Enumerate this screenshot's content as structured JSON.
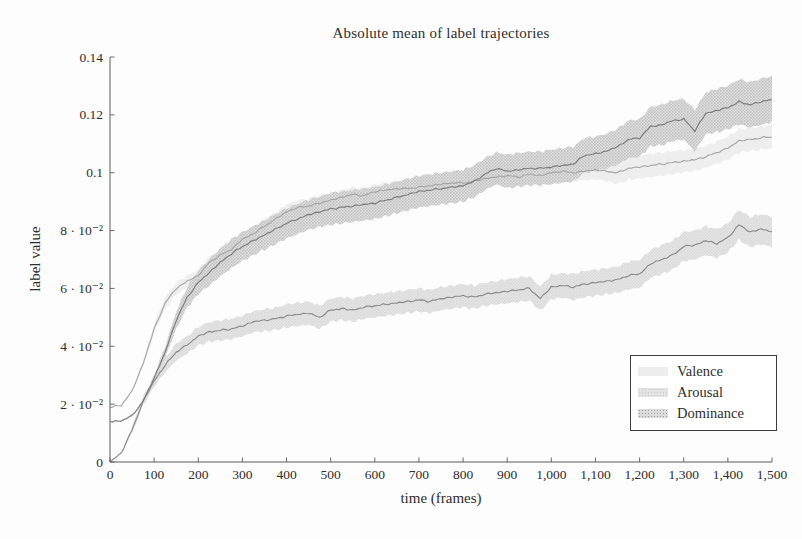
{
  "page": {
    "background": "#fdfdfd",
    "text_color": "#2e2e2e",
    "axis_color": "#5a5a5a"
  },
  "chart_data": {
    "type": "line",
    "title": "Absolute mean of label trajectories",
    "xlabel": "time (frames)",
    "ylabel": "label value",
    "xlim": [
      0,
      1500
    ],
    "ylim": [
      0,
      0.14
    ],
    "grid": false,
    "frame": "open-left-bottom",
    "xticks": {
      "values": [
        0,
        100,
        200,
        300,
        400,
        500,
        600,
        700,
        800,
        900,
        1000,
        1100,
        1200,
        1300,
        1400,
        1500
      ],
      "labels": [
        "0",
        "100",
        "200",
        "300",
        "400",
        "500",
        "600",
        "700",
        "800",
        "900",
        "1,000",
        "1,100",
        "1,200",
        "1,300",
        "1,400",
        "1,500"
      ]
    },
    "yticks": {
      "values": [
        0,
        0.02,
        0.04,
        0.06,
        0.08,
        0.1,
        0.12,
        0.14
      ],
      "labels": [
        "0",
        "2 · 10⁻²",
        "4 · 10⁻²",
        "6 · 10⁻²",
        "8 · 10⁻²",
        "0.1",
        "0.12",
        "0.14"
      ]
    },
    "legend": {
      "position": "bottom-right",
      "entries": [
        "Valence",
        "Arousal",
        "Dominance"
      ]
    },
    "x": [
      0,
      25,
      50,
      75,
      100,
      125,
      150,
      175,
      200,
      225,
      250,
      275,
      300,
      325,
      350,
      375,
      400,
      425,
      450,
      475,
      500,
      525,
      550,
      575,
      600,
      625,
      650,
      675,
      700,
      725,
      750,
      775,
      800,
      825,
      850,
      875,
      900,
      925,
      950,
      975,
      1000,
      1025,
      1050,
      1075,
      1100,
      1125,
      1150,
      1175,
      1200,
      1225,
      1250,
      1275,
      1300,
      1325,
      1350,
      1375,
      1400,
      1425,
      1450,
      1475,
      1500
    ],
    "series": [
      {
        "name": "Valence",
        "line_color": "#a6a6a6",
        "band_color": "#ededed",
        "band_dot_color": null,
        "values": [
          0.019,
          0.0195,
          0.0245,
          0.034,
          0.046,
          0.055,
          0.06,
          0.0625,
          0.0645,
          0.069,
          0.0715,
          0.0735,
          0.077,
          0.079,
          0.0815,
          0.084,
          0.0865,
          0.088,
          0.0885,
          0.0895,
          0.0905,
          0.0915,
          0.0925,
          0.092,
          0.0935,
          0.094,
          0.0945,
          0.0945,
          0.095,
          0.0955,
          0.096,
          0.0965,
          0.0965,
          0.097,
          0.098,
          0.0985,
          0.099,
          0.0985,
          0.0995,
          0.099,
          0.1,
          0.1005,
          0.1,
          0.1005,
          0.101,
          0.1005,
          0.1,
          0.1015,
          0.102,
          0.1025,
          0.103,
          0.1035,
          0.104,
          0.1045,
          0.1055,
          0.107,
          0.1085,
          0.111,
          0.1115,
          0.112,
          0.1125
        ],
        "band": [
          0,
          0,
          0,
          0.001,
          0.0015,
          0.002,
          0.002,
          0.002,
          0.002,
          0.002,
          0.002,
          0.002,
          0.0022,
          0.0022,
          0.0022,
          0.0022,
          0.0025,
          0.0025,
          0.0025,
          0.0025,
          0.0025,
          0.0025,
          0.0025,
          0.0025,
          0.0025,
          0.0025,
          0.0025,
          0.0025,
          0.0025,
          0.0025,
          0.0025,
          0.0025,
          0.0025,
          0.0025,
          0.0025,
          0.0028,
          0.0028,
          0.0028,
          0.0028,
          0.0028,
          0.003,
          0.003,
          0.003,
          0.003,
          0.0032,
          0.0035,
          0.0038,
          0.004,
          0.004,
          0.004,
          0.004,
          0.004,
          0.0038,
          0.0038,
          0.0038,
          0.0038,
          0.004,
          0.004,
          0.004,
          0.004,
          0.004
        ]
      },
      {
        "name": "Arousal",
        "line_color": "#8a8a8a",
        "band_color": "#e3e3e3",
        "band_dot_color": "#cccccc",
        "values": [
          0.0,
          0.003,
          0.011,
          0.021,
          0.028,
          0.0335,
          0.038,
          0.0405,
          0.0435,
          0.045,
          0.0455,
          0.046,
          0.047,
          0.0485,
          0.049,
          0.0495,
          0.0505,
          0.051,
          0.0515,
          0.05,
          0.0525,
          0.053,
          0.0525,
          0.0535,
          0.054,
          0.0545,
          0.055,
          0.0555,
          0.056,
          0.0555,
          0.0565,
          0.057,
          0.0575,
          0.057,
          0.058,
          0.0585,
          0.059,
          0.0595,
          0.06,
          0.0565,
          0.0605,
          0.061,
          0.0605,
          0.0615,
          0.062,
          0.0625,
          0.063,
          0.0645,
          0.065,
          0.0685,
          0.07,
          0.0715,
          0.0745,
          0.075,
          0.0765,
          0.0755,
          0.0775,
          0.082,
          0.0795,
          0.0805,
          0.0795
        ],
        "band": [
          0,
          0,
          0.001,
          0.0015,
          0.002,
          0.0025,
          0.003,
          0.003,
          0.0032,
          0.0034,
          0.0035,
          0.0035,
          0.0036,
          0.0036,
          0.0038,
          0.0038,
          0.004,
          0.004,
          0.004,
          0.004,
          0.004,
          0.004,
          0.004,
          0.004,
          0.004,
          0.004,
          0.004,
          0.004,
          0.004,
          0.004,
          0.004,
          0.004,
          0.004,
          0.004,
          0.004,
          0.004,
          0.0042,
          0.0042,
          0.0042,
          0.0042,
          0.0042,
          0.0042,
          0.0045,
          0.0045,
          0.0045,
          0.0045,
          0.0045,
          0.0048,
          0.0048,
          0.0048,
          0.005,
          0.005,
          0.005,
          0.005,
          0.005,
          0.005,
          0.005,
          0.0052,
          0.0052,
          0.0052,
          0.0052
        ]
      },
      {
        "name": "Dominance",
        "line_color": "#7c7c7c",
        "band_color": "#dcdcdc",
        "band_dot_color": "#9e9e9e",
        "values": [
          0.014,
          0.0142,
          0.016,
          0.021,
          0.029,
          0.038,
          0.049,
          0.057,
          0.062,
          0.0655,
          0.069,
          0.072,
          0.0745,
          0.0765,
          0.0785,
          0.0805,
          0.0825,
          0.084,
          0.0855,
          0.0865,
          0.0875,
          0.088,
          0.0885,
          0.089,
          0.0895,
          0.0905,
          0.0915,
          0.0925,
          0.0935,
          0.094,
          0.0945,
          0.095,
          0.0955,
          0.097,
          0.0995,
          0.1015,
          0.1005,
          0.101,
          0.1015,
          0.1015,
          0.102,
          0.1025,
          0.103,
          0.106,
          0.1065,
          0.1075,
          0.109,
          0.1115,
          0.112,
          0.116,
          0.1165,
          0.118,
          0.1185,
          0.1145,
          0.1205,
          0.1215,
          0.1225,
          0.1245,
          0.1235,
          0.1245,
          0.1255
        ],
        "band": [
          0,
          0,
          0,
          0,
          0.001,
          0.002,
          0.003,
          0.0035,
          0.004,
          0.0045,
          0.0048,
          0.005,
          0.005,
          0.005,
          0.005,
          0.0052,
          0.0052,
          0.0052,
          0.0052,
          0.0052,
          0.0055,
          0.0055,
          0.0055,
          0.0055,
          0.0055,
          0.0055,
          0.0055,
          0.0055,
          0.0055,
          0.0055,
          0.0055,
          0.0055,
          0.0055,
          0.0055,
          0.0055,
          0.0055,
          0.0058,
          0.0058,
          0.0058,
          0.0058,
          0.006,
          0.006,
          0.006,
          0.006,
          0.006,
          0.006,
          0.0062,
          0.0065,
          0.0065,
          0.0068,
          0.007,
          0.007,
          0.007,
          0.0072,
          0.0072,
          0.0075,
          0.0075,
          0.0078,
          0.0078,
          0.008,
          0.008
        ]
      }
    ]
  }
}
